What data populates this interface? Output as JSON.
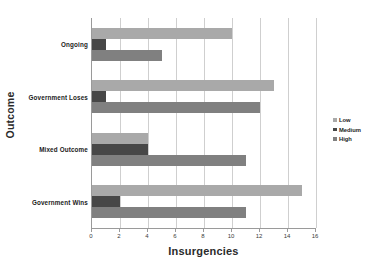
{
  "chart_data": {
    "type": "bar",
    "orientation": "horizontal",
    "title": "",
    "xlabel": "Insurgencies",
    "ylabel": "Outcome",
    "categories": [
      "Ongoing",
      "Government Loses",
      "Mixed Outcome",
      "Government Wins"
    ],
    "series": [
      {
        "name": "Low",
        "values": [
          10,
          13,
          4,
          15
        ],
        "color": "#a9a9a9"
      },
      {
        "name": "Medium",
        "values": [
          1,
          1,
          4,
          2
        ],
        "color": "#474747"
      },
      {
        "name": "High",
        "values": [
          5,
          12,
          11,
          11
        ],
        "color": "#808080"
      }
    ],
    "xlim": [
      0,
      16
    ],
    "xticks": [
      0,
      2,
      4,
      6,
      8,
      10,
      12,
      14,
      16
    ],
    "xtick_labels": [
      "0",
      "2",
      "4",
      "6",
      "8",
      "10",
      "12",
      "14",
      "16"
    ],
    "grid": true,
    "grid_axis": "x",
    "legend_position": "right",
    "legend_entries": [
      "Low",
      "Medium",
      "High"
    ],
    "colors": {
      "low": "#a9a9a9",
      "medium": "#474747",
      "high": "#808080",
      "grid": "#cfcfcf",
      "axis": "#9a9a9a",
      "text": "#1a1a1a",
      "background": "#ffffff"
    }
  }
}
